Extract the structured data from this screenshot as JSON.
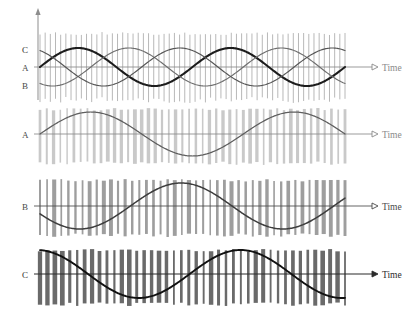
{
  "figure": {
    "type": "waveform-diagram",
    "width": 418,
    "height": 324,
    "background": "#ffffff"
  },
  "vertical_axis": {
    "name": "amplitude-axis",
    "arrow": "up",
    "label": "",
    "x": 38,
    "y_top": 8,
    "y_bottom": 100
  },
  "panels": [
    {
      "id": "panel-combined",
      "index": 1,
      "left_labels": [
        {
          "text": "C",
          "y": 49,
          "tone": "dark"
        },
        {
          "text": "A",
          "y": 67,
          "tone": "mid"
        },
        {
          "text": "B",
          "y": 85,
          "tone": "mid"
        }
      ],
      "time_axis": {
        "label": "Time",
        "arrow": "left-right",
        "tone": "light",
        "baseline_y": 67
      },
      "carrier": {
        "name": "carrier-pulse-train",
        "count": 60,
        "color": "#b8b8b8",
        "stroke_width": 1.0,
        "top": 32,
        "bottom": 103
      },
      "waves": [
        {
          "name": "wave-c",
          "phase_deg": 0,
          "color": "#1c1c1c",
          "stroke_width": 2.1,
          "amplitude": 19,
          "cycles": 2,
          "baseline_y": 67
        },
        {
          "name": "wave-a",
          "phase_deg": 240,
          "color": "#6e6e6e",
          "stroke_width": 1.15,
          "amplitude": 19,
          "cycles": 2,
          "baseline_y": 67
        },
        {
          "name": "wave-b",
          "phase_deg": 120,
          "color": "#555555",
          "stroke_width": 1.15,
          "amplitude": 19,
          "cycles": 2,
          "baseline_y": 67
        }
      ]
    },
    {
      "id": "panel-a",
      "index": 2,
      "left_labels": [
        {
          "text": "A",
          "y": 134,
          "tone": "mid"
        }
      ],
      "time_axis": {
        "label": "Time",
        "arrow": "left-right",
        "tone": "light",
        "baseline_y": 134
      },
      "carrier": {
        "name": "pwm-bars-a",
        "count": 46,
        "color": "#c9c9c9",
        "stroke_width": 2.6,
        "top": 108,
        "bottom": 165
      },
      "waves": [
        {
          "name": "wave-a",
          "phase_deg": 0,
          "color": "#5e5e5e",
          "stroke_width": 1.25,
          "amplitude": 22,
          "cycles": 1.5,
          "baseline_y": 134
        }
      ]
    },
    {
      "id": "panel-b",
      "index": 3,
      "left_labels": [
        {
          "text": "B",
          "y": 206,
          "tone": "mid"
        }
      ],
      "time_axis": {
        "label": "Time",
        "arrow": "left-right",
        "tone": "mid",
        "baseline_y": 206
      },
      "carrier": {
        "name": "pwm-bars-b",
        "count": 44,
        "color": "#9e9e9e",
        "stroke_width": 2.8,
        "top": 179,
        "bottom": 237
      },
      "waves": [
        {
          "name": "wave-b",
          "phase_deg": 200,
          "color": "#3d3d3d",
          "stroke_width": 1.5,
          "amplitude": 23,
          "cycles": 1.5,
          "baseline_y": 206
        }
      ]
    },
    {
      "id": "panel-c",
      "index": 4,
      "left_labels": [
        {
          "text": "C",
          "y": 274,
          "tone": "dark"
        }
      ],
      "time_axis": {
        "label": "Time",
        "arrow": "right",
        "tone": "dark",
        "baseline_y": 274
      },
      "carrier": {
        "name": "pwm-bars-c",
        "count": 42,
        "color": "#6a6a6a",
        "stroke_width": 3.2,
        "top": 249,
        "bottom": 306
      },
      "waves": [
        {
          "name": "wave-c",
          "phase_deg": 95,
          "color": "#111111",
          "stroke_width": 1.9,
          "amplitude": 24,
          "cycles": 1.5,
          "baseline_y": 274
        }
      ]
    }
  ],
  "chart_data": {
    "type": "line",
    "title": "",
    "xlabel": "Time",
    "ylabel": "",
    "legend": [
      "A",
      "B",
      "C"
    ],
    "series": [
      {
        "name": "A",
        "phase_deg": 240,
        "normalized_amplitude": 1.0
      },
      {
        "name": "B",
        "phase_deg": 120,
        "normalized_amplitude": 1.0
      },
      {
        "name": "C",
        "phase_deg": 0,
        "normalized_amplitude": 1.0
      }
    ]
  }
}
